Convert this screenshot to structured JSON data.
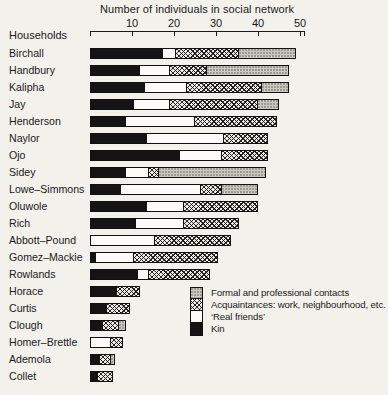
{
  "title": "Number of individuals in social network",
  "y_axis_header": "Households",
  "axis_ticks": [
    10,
    20,
    30,
    40,
    50
  ],
  "colors": {
    "ink": "#1a1a1a",
    "paper": "#f2f1ec",
    "kin_black": "#141414",
    "real_friends_white": "#fcfbf8",
    "formal_gray": "#cac9c3"
  },
  "legend": [
    {
      "key": "formal",
      "label": "Formal and professional contacts"
    },
    {
      "key": "acquaintances",
      "label": "Acquaintances: work, neighbourhood, etc."
    },
    {
      "key": "real_friends",
      "label": "‘Real friends’"
    },
    {
      "key": "kin",
      "label": "Kin"
    }
  ],
  "chart_data": {
    "type": "bar",
    "orientation": "horizontal",
    "stacked": true,
    "title": "Number of individuals in social network",
    "xlabel": "Number of individuals in social network",
    "ylabel": "Households",
    "xlim": [
      0,
      51
    ],
    "grid": false,
    "legend_position": "bottom-right",
    "segment_order": [
      "kin",
      "real_friends",
      "acquaintances",
      "formal"
    ],
    "categories": [
      "Birchall",
      "Handbury",
      "Kalipha",
      "Jay",
      "Henderson",
      "Naylor",
      "Ojo",
      "Sidey",
      "Lowe–Simmons",
      "Oluwole",
      "Rich",
      "Abbott–Pound",
      "Gomez–Mackie",
      "Rowlands",
      "Horace",
      "Curtis",
      "Clough",
      "Homer–Brettle",
      "Ademola",
      "Collet"
    ],
    "series": [
      {
        "key": "kin",
        "name": "Kin",
        "values": [
          17,
          11.5,
          12.5,
          10,
          8,
          13,
          21,
          8,
          7,
          13,
          10.5,
          0,
          1,
          11,
          6,
          3.5,
          2.5,
          0,
          2,
          1.5
        ]
      },
      {
        "key": "real_friends",
        "name": "‘Real friends’",
        "values": [
          3,
          7,
          10,
          8.5,
          16.5,
          18.5,
          10,
          5.5,
          19,
          9,
          11.5,
          15,
          9,
          2.5,
          0,
          0,
          0,
          4.5,
          0,
          0
        ]
      },
      {
        "key": "acquaintances",
        "name": "Acquaintances: work, neighbourhood, etc.",
        "values": [
          15,
          9,
          18,
          21,
          19.5,
          10.5,
          11,
          2.5,
          5,
          17.5,
          13,
          18,
          20,
          14.5,
          5.5,
          5.5,
          4,
          3,
          2.5,
          3.5
        ]
      },
      {
        "key": "formal",
        "name": "Formal and professional contacts",
        "values": [
          13.5,
          19.5,
          6.5,
          5,
          0,
          0,
          0,
          25.5,
          8.5,
          0,
          0,
          0,
          0,
          0,
          0,
          0,
          1.5,
          0,
          1,
          0
        ]
      }
    ],
    "totals": [
      48.5,
      47,
      47,
      44.5,
      44,
      42,
      42,
      41.5,
      39.5,
      39.5,
      35,
      33,
      30,
      28,
      11.5,
      9,
      8,
      7.5,
      5.5,
      5
    ]
  }
}
